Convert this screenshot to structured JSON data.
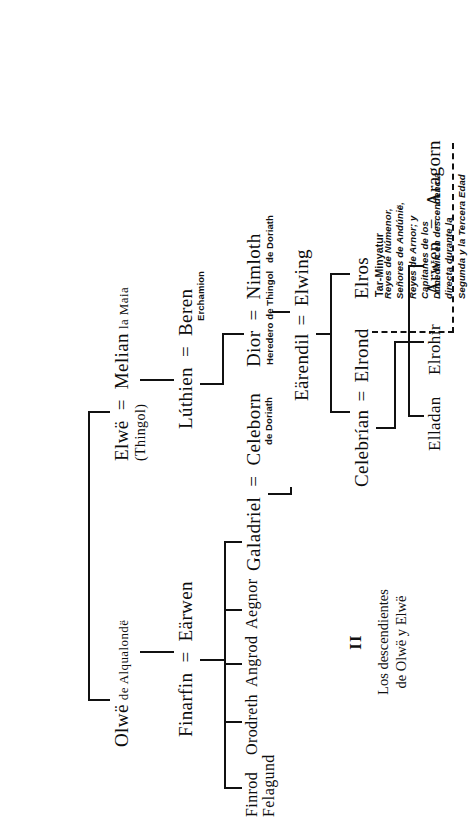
{
  "figure": {
    "numeral": "II",
    "caption": "Los descendientes\nde Olwë y Elwë"
  },
  "nodes": {
    "olwe": {
      "name": "Olwë",
      "qualifier": "de Alqualondë"
    },
    "elwe": {
      "name": "Elwë",
      "qualifier": "(Thingol)"
    },
    "melian": {
      "name": "Melian",
      "qualifier": "la Maia"
    },
    "finarfin": {
      "name": "Finarfin",
      "qualifier": ""
    },
    "earwen": {
      "name": "Eärwen",
      "qualifier": ""
    },
    "luthien": {
      "name": "Lúthien",
      "qualifier": ""
    },
    "beren": {
      "name": "Beren",
      "qualifier": "Erchamion"
    },
    "finrod": {
      "name": "Finrod",
      "qualifier": "Felagund"
    },
    "orodreth": {
      "name": "Orodreth",
      "qualifier": ""
    },
    "angrod": {
      "name": "Angrod",
      "qualifier": ""
    },
    "aegnor": {
      "name": "Aegnor",
      "qualifier": ""
    },
    "galadriel": {
      "name": "Galadriel",
      "qualifier": ""
    },
    "celeborn": {
      "name": "Celeborn",
      "qualifier": "de Doriath"
    },
    "dior": {
      "name": "Dior",
      "qualifier": "Heredero\nde Thingol"
    },
    "nimloth": {
      "name": "Nimloth",
      "qualifier": "de Doriath"
    },
    "celebrian": {
      "name": "Celebrían",
      "qualifier": ""
    },
    "earendil": {
      "name": "Eärendil",
      "qualifier": ""
    },
    "elwing": {
      "name": "Elwing",
      "qualifier": ""
    },
    "elrond": {
      "name": "Elrond",
      "qualifier": ""
    },
    "elros": {
      "name": "Elros",
      "qualifier": "Tar-Minyatur"
    },
    "elladan": {
      "name": "Elladan",
      "qualifier": ""
    },
    "elrohir": {
      "name": "Elrohir",
      "qualifier": ""
    },
    "arwen": {
      "name": "Arwen",
      "qualifier": ""
    },
    "aragorn": {
      "name": "Aragorn",
      "qualifier": ""
    }
  },
  "symbols": {
    "marriage": "="
  },
  "annotations": {
    "elros_line": "Reyes de Númenor,\nSeñores de Andúnië,\nReyes de Arnor; y\nCapitanes de los\nDúnedain en descendencia\ndirecta durante la\nSegunda y la Tercera Edad"
  },
  "colors": {
    "ink": "#111111",
    "paper": "#ffffff"
  }
}
